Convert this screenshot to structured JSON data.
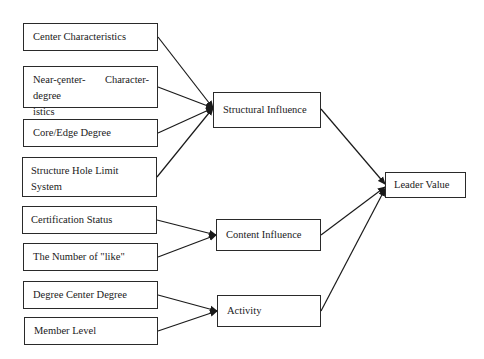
{
  "diagram": {
    "type": "flow-diagram",
    "inputs": [
      {
        "id": "center-characteristics",
        "label": "Center Characteristics",
        "target": "structural-influence"
      },
      {
        "id": "near-center-degree",
        "label_line1_a": "Near-çenter-degree",
        "label_line1_b": "Character-",
        "label_line2": "istics",
        "target": "structural-influence"
      },
      {
        "id": "core-edge-degree",
        "label": "Core/Edge Degree",
        "target": "structural-influence"
      },
      {
        "id": "structure-hole-limit-system",
        "label": "Structure Hole Limit System",
        "target": "structural-influence"
      },
      {
        "id": "certification-status",
        "label": "Certification Status",
        "target": "content-influence"
      },
      {
        "id": "number-of-like",
        "label": "The Number of \"like\"",
        "target": "content-influence"
      },
      {
        "id": "degree-center-degree",
        "label": "Degree Center Degree",
        "target": "activity"
      },
      {
        "id": "member-level",
        "label": "Member Level",
        "target": "activity"
      }
    ],
    "intermediates": [
      {
        "id": "structural-influence",
        "label": "Structural Influence",
        "target": "leader-value"
      },
      {
        "id": "content-influence",
        "label": "Content Influence",
        "target": "leader-value"
      },
      {
        "id": "activity",
        "label": "Activity",
        "target": "leader-value"
      }
    ],
    "output": {
      "id": "leader-value",
      "label": "Leader Value"
    },
    "colors": {
      "border": "#2a2a2a",
      "line": "#1a1a1a",
      "background": "#ffffff"
    }
  }
}
